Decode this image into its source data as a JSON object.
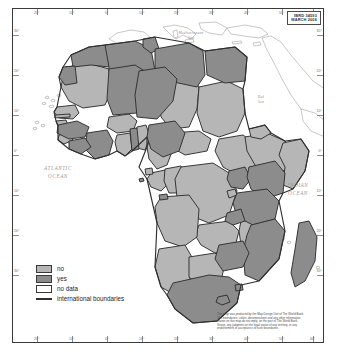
{
  "map": {
    "title": "Africa thematic map",
    "id_box": {
      "ibrd_number": "IBRD 34593",
      "date": "MARCH 2006"
    },
    "ocean_labels": [
      {
        "name": "atlantic-ocean",
        "line1": "ATLANTIC",
        "line2": "OCEAN"
      },
      {
        "name": "indian-ocean",
        "line1": "INDIAN",
        "line2": "OCEAN"
      }
    ],
    "sea_labels": [
      {
        "name": "mediterranean-sea",
        "line1": "Mediterranean",
        "line2": "Sea"
      },
      {
        "name": "red-sea",
        "line1": "Red",
        "line2": "Sea"
      }
    ],
    "legend": {
      "items": [
        {
          "label": "no",
          "swatch": "fill",
          "color": "#b6b6b6"
        },
        {
          "label": "yes",
          "swatch": "fill",
          "color": "#8c8c8c"
        },
        {
          "label": "no data",
          "swatch": "fill",
          "color": "#ffffff"
        },
        {
          "label": "international boundaries",
          "swatch": "line",
          "color": "#2f2f2f"
        }
      ]
    },
    "disclaimer": {
      "line1": "This map was produced by the Map Design Unit of The World Bank.",
      "line2": "The boundaries, colors, denominations and any other information",
      "line3": "shown on this map do not imply, on the part of The World Bank",
      "line4": "Group, any judgment on the legal status of any territory, or any",
      "line5": "endorsement or acceptance of such boundaries."
    },
    "graticule": {
      "top_labels": [
        "20°",
        "10°",
        "0°",
        "10°",
        "20°",
        "30°",
        "40°",
        "50°",
        "60°"
      ],
      "bottom_labels": [
        "20°",
        "10°",
        "0°",
        "10°",
        "20°",
        "30°",
        "40°",
        "50°",
        "60°"
      ],
      "left_labels": [
        "30°",
        "20°",
        "10°",
        "0°",
        "10°",
        "20°",
        "30°"
      ],
      "right_labels": [
        "30°",
        "20°",
        "10°",
        "0°",
        "10°",
        "20°",
        "30°"
      ]
    },
    "colors": {
      "category_no": "#b6b6b6",
      "category_yes": "#8c8c8c",
      "category_no_data": "#ffffff",
      "boundary": "#2f2f2f",
      "frame": "#3a3a3a",
      "non_africa_land": "#ffffff",
      "non_africa_outline": "#9b9b9b"
    }
  }
}
